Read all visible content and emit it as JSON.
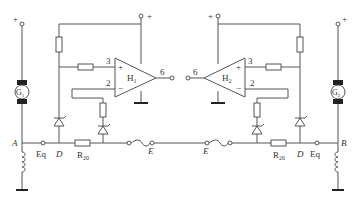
{
  "diagram": {
    "type": "circuit-schematic",
    "colors": {
      "line": "#555555",
      "fill_dark": "#222222",
      "text": "#333333"
    },
    "left": {
      "motor_label": "G",
      "motor_sub": "1",
      "supply": "+",
      "opamp_label": "H",
      "opamp_sub": "1",
      "opamp_supply": "+",
      "pin_noninv": "3",
      "pin_inv": "2",
      "pin_out": "6",
      "sign_plus": "+",
      "sign_minus": "−",
      "node_a": "A",
      "node_eq": "Eq",
      "node_d": "D",
      "resistor": "R",
      "resistor_sub": "20",
      "node_e": "E"
    },
    "right": {
      "motor_label": "G",
      "motor_sub": "2",
      "supply": "+",
      "opamp_label": "H",
      "opamp_sub": "2",
      "opamp_supply": "+",
      "pin_noninv": "3",
      "pin_inv": "2",
      "pin_out": "6",
      "sign_plus": "+",
      "sign_minus": "−",
      "node_b": "B",
      "node_eq": "Eq",
      "node_d": "D",
      "resistor": "R",
      "resistor_sub": "20",
      "node_e": "E"
    }
  }
}
